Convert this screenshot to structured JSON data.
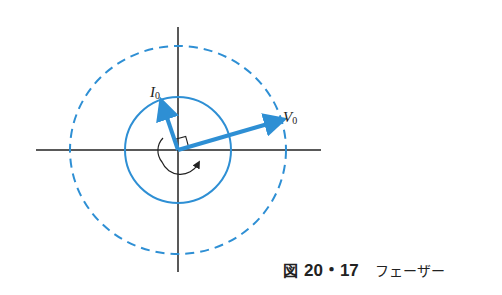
{
  "diagram": {
    "colors": {
      "phasor": "#2e8fd4",
      "axis": "#222222",
      "background": "#ffffff"
    },
    "center": [
      178,
      150
    ],
    "inner_circle_radius": 53,
    "outer_circle_radius": [
      108,
      104
    ],
    "phasors": [
      {
        "name": "I",
        "subscript": "0",
        "tip": [
          162,
          102
        ]
      },
      {
        "name": "V",
        "subscript": "0",
        "tip": [
          283,
          119
        ]
      }
    ],
    "right_angle_marker": true,
    "rotation": "counterclockwise"
  },
  "labels": {
    "i_main": "I",
    "i_sub": "0",
    "v_main": "V",
    "v_sub": "0"
  },
  "caption": {
    "prefix": "図",
    "number": "20・17",
    "title": "フェーザー"
  }
}
